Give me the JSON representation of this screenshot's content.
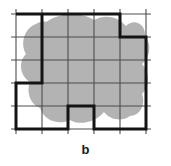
{
  "figure": {
    "caption": "b",
    "type": "grid-approximation-diagram",
    "colors": {
      "blob_fill": "#b3b3b3",
      "grid_line": "#4d4d4d",
      "bold_outline": "#141414",
      "background": "#ffffff",
      "caption_color": "#1a1a1a"
    },
    "grid": {
      "columns": 5,
      "rows": 5,
      "x_positions": [
        16,
        42,
        68,
        94,
        120,
        146
      ],
      "y_positions": [
        14,
        37,
        60,
        83,
        106,
        129
      ],
      "tick_overhang": 5,
      "line_width": 1.1
    },
    "blob": {
      "name": "region-blob",
      "path": "M 46 22 C 60 12 82 12 94 20 C 104 14 118 16 126 26 C 134 18 146 24 145 36 C 152 44 150 58 142 64 C 150 72 150 86 142 94 C 146 104 140 116 130 116 C 122 122 110 120 104 112 C 96 122 80 126 70 120 C 58 126 44 120 40 108 C 30 104 26 92 30 82 C 20 76 18 62 26 54 C 20 44 24 28 36 24 C 39 22 43 21 46 22 Z"
    },
    "bold_outline": {
      "name": "staircase-outline",
      "line_width": 3,
      "vertices": [
        [
          16,
          14
        ],
        [
          120,
          14
        ],
        [
          120,
          37
        ],
        [
          146,
          37
        ],
        [
          146,
          129
        ],
        [
          94,
          129
        ],
        [
          94,
          106
        ],
        [
          68,
          106
        ],
        [
          68,
          129
        ],
        [
          16,
          129
        ],
        [
          16,
          83
        ],
        [
          42,
          83
        ],
        [
          42,
          14
        ]
      ]
    }
  }
}
